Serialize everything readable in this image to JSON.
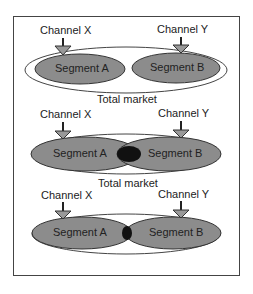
{
  "diagram": {
    "panels": [
      {
        "channel_x": "Channel X",
        "channel_y": "Channel Y",
        "segment_a": "Segment A",
        "segment_b": "Segment B",
        "caption": "Total market",
        "overlap": "none"
      },
      {
        "channel_x": "Channel X",
        "channel_y": "Channel Y",
        "segment_a": "Segment A",
        "segment_b": "Segment B",
        "caption": "Total market",
        "overlap": "large"
      },
      {
        "channel_x": "Channel X",
        "channel_y": "Channel Y",
        "segment_a": "Segment A",
        "segment_b": "Segment B",
        "caption": "",
        "overlap": "small"
      }
    ],
    "colors": {
      "segment_fill": "#8c8c8c",
      "overlap_fill": "#111111",
      "outline": "#333333",
      "frame": "#444444"
    }
  }
}
